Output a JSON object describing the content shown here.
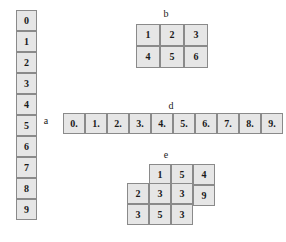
{
  "diagram": {
    "background_color": "#ffffff",
    "cell_fill_color": "#e6e6e6",
    "cell_border_color": "#8a8a8a",
    "text_color": "#1a1a1a"
  },
  "structures": {
    "a": {
      "label": "a",
      "orientation": "vertical",
      "rows": 10,
      "cols": 1,
      "values": [
        "0",
        "1",
        "2",
        "3",
        "4",
        "5",
        "6",
        "7",
        "8",
        "9"
      ]
    },
    "b": {
      "label": "b",
      "orientation": "grid",
      "rows": 2,
      "cols": 3,
      "values": [
        [
          "1",
          "2",
          "3"
        ],
        [
          "4",
          "5",
          "6"
        ]
      ]
    },
    "d": {
      "label": "d",
      "orientation": "horizontal",
      "rows": 1,
      "cols": 10,
      "values": [
        "0.",
        "1.",
        "2.",
        "3.",
        "4.",
        "5.",
        "6.",
        "7.",
        "8.",
        "9."
      ]
    },
    "e": {
      "label": "e",
      "orientation": "stacked-offset",
      "back_layer": {
        "rows": 2,
        "cols": 3,
        "values": [
          [
            "1",
            "5",
            "4"
          ],
          [
            "",
            "",
            "9"
          ]
        ]
      },
      "front_layer": {
        "rows": 2,
        "cols": 3,
        "values": [
          [
            "2",
            "3",
            "3"
          ],
          [
            "3",
            "5",
            "3"
          ]
        ]
      },
      "top_row_values": [
        "1",
        "5",
        "4"
      ],
      "middle_row_values": [
        "2",
        "3",
        "3",
        "9"
      ],
      "bottom_row_values": [
        "3",
        "5",
        "3"
      ]
    }
  }
}
